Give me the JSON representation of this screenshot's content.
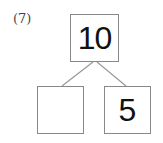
{
  "problem": {
    "number_label": "(7)",
    "whole": "10",
    "part_left": "",
    "part_right": "5"
  }
}
